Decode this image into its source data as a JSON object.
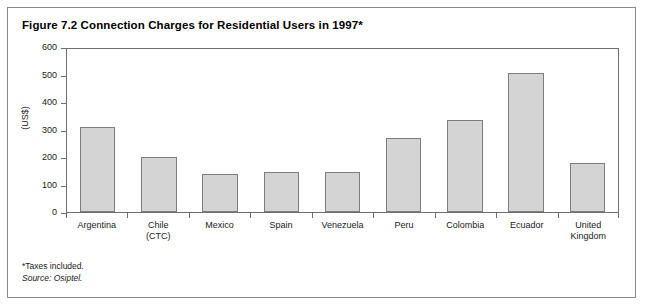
{
  "figure": {
    "title": "Figure 7.2 Connection Charges for Residential Users in 1997*",
    "note_taxes": "*Taxes included.",
    "note_source": "Source: Osiptel."
  },
  "colors": {
    "bar_fill": "#d4d4d4",
    "bar_border": "#7d7d7d",
    "axis": "#6e6e6e",
    "frame": "#8a8a8a",
    "text": "#1a1a1a",
    "background": "#ffffff"
  },
  "chart_data": {
    "type": "bar",
    "title": "Figure 7.2 Connection Charges for Residential Users in 1997*",
    "xlabel": "",
    "ylabel": "(US$)",
    "ylim": [
      0,
      600
    ],
    "yticks": [
      0,
      100,
      200,
      300,
      400,
      500,
      600
    ],
    "ytick_labels": [
      "0",
      "100",
      "200",
      "300",
      "400",
      "500",
      "600"
    ],
    "grid": false,
    "legend": false,
    "categories": [
      "Argentina",
      "Chile (CTC)",
      "Mexico",
      "Spain",
      "Venezuela",
      "Peru",
      "Colombia",
      "Ecuador",
      "United Kingdom"
    ],
    "category_lines": [
      [
        "Argentina"
      ],
      [
        "Chile",
        "(CTC)"
      ],
      [
        "Mexico"
      ],
      [
        "Spain"
      ],
      [
        "Venezuela"
      ],
      [
        "Peru"
      ],
      [
        "Colombia"
      ],
      [
        "Ecuador"
      ],
      [
        "United",
        "Kingdom"
      ]
    ],
    "values": [
      310,
      200,
      138,
      145,
      145,
      270,
      335,
      505,
      180
    ],
    "units": "US$"
  }
}
